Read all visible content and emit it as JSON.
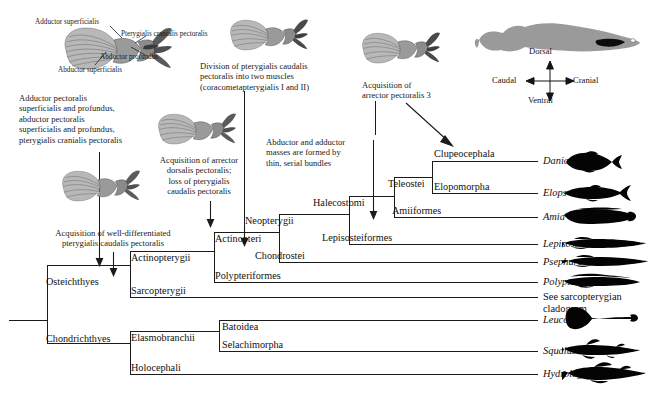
{
  "figure": {
    "type": "phylogenetic-cladogram",
    "background_color": "#ffffff",
    "line_color": "#1b1b1b",
    "silhouette_color": "#000000",
    "fin_fill_color": "#8d8d8d"
  },
  "muscle_labels": [
    {
      "id": "adductor-superficialis",
      "text": "Adductor superficialis"
    },
    {
      "id": "pterygialis-cranialis-pectoralis",
      "text": "Pterygialis cranialis\npectoralis"
    },
    {
      "id": "abductor-profundus",
      "text": "Abductor profundus"
    },
    {
      "id": "abductor-superficialis",
      "text": "Abductor superficialis"
    }
  ],
  "annotations": [
    {
      "id": "ann-osteichthyes-base",
      "text": "Adductor pectoralis\nsuperficialis and profundus,\nabductor pectoralis\nsuperficialis and profundus,\npterygialis cranialis pectoralis"
    },
    {
      "id": "ann-arrector-dorsalis",
      "text": "Acquisition of arrector\ndorsalis pectoralis;\nloss of pterygialis\ncaudalis pectoralis"
    },
    {
      "id": "ann-well-differentiated-pterygialis",
      "text": "Acquisition of well-differentiated\npterygialis caudalis pectoralis"
    },
    {
      "id": "ann-division-pterygialis",
      "text": "Division of pterygialis caudalis\npectoralis into two muscles\n(coracometapterygialis I and II)"
    },
    {
      "id": "ann-serial-bundles",
      "text": "Abductor and adductor\nmasses are formed by\nthin, serial bundles"
    },
    {
      "id": "ann-arrector-pectoralis-3",
      "text": "Acquisition of\narrector pectoralis 3"
    }
  ],
  "clades": [
    {
      "id": "osteichthyes",
      "label": "Osteichthyes"
    },
    {
      "id": "chondrichthyes",
      "label": "Chondrichthyes"
    },
    {
      "id": "actinopterygii",
      "label": "Actinopterygii"
    },
    {
      "id": "sarcopterygii",
      "label": "Sarcopterygii"
    },
    {
      "id": "actinopteri",
      "label": "Actinopteri"
    },
    {
      "id": "polypteriformes",
      "label": "Polypteriformes"
    },
    {
      "id": "neopterygii",
      "label": "Neopterygii"
    },
    {
      "id": "chondrostei",
      "label": "Chondrostei"
    },
    {
      "id": "halecostomi",
      "label": "Halecostomi"
    },
    {
      "id": "lepisosteiformes",
      "label": "Lepisosteiformes"
    },
    {
      "id": "teleostei",
      "label": "Teleostei"
    },
    {
      "id": "amiiformes",
      "label": "Amiiformes"
    },
    {
      "id": "clupeocephala",
      "label": "Clupeocephala"
    },
    {
      "id": "elopomorpha",
      "label": "Elopomorpha"
    },
    {
      "id": "elasmobranchii",
      "label": "Elasmobranchii"
    },
    {
      "id": "holocephali",
      "label": "Holocephali"
    },
    {
      "id": "batoidea",
      "label": "Batoidea"
    },
    {
      "id": "selachimorpha",
      "label": "Selachimorpha"
    }
  ],
  "taxa": [
    {
      "id": "danio",
      "label": "Danio",
      "italic": true,
      "silhouette": "danio"
    },
    {
      "id": "elops",
      "label": "Elops",
      "italic": true,
      "silhouette": "elops"
    },
    {
      "id": "amia",
      "label": "Amia",
      "italic": true,
      "silhouette": "amia"
    },
    {
      "id": "lepisosteus",
      "label": "Lepisosteus",
      "italic": true,
      "silhouette": "lepisosteus"
    },
    {
      "id": "psephurus",
      "label": "Psephurus",
      "italic": true,
      "silhouette": "psephurus"
    },
    {
      "id": "polypterus",
      "label": "Polypterus",
      "italic": true,
      "silhouette": "polypterus"
    },
    {
      "id": "sarcopterygian-ref",
      "label": "See sarcopterygian\ncladogram",
      "italic": false,
      "silhouette": "none"
    },
    {
      "id": "leucoraja",
      "label": "Leucoraja",
      "italic": true,
      "silhouette": "leucoraja"
    },
    {
      "id": "squalus",
      "label": "Squalus",
      "italic": true,
      "silhouette": "squalus"
    },
    {
      "id": "hydrolagus",
      "label": "Hydrolagus",
      "italic": true,
      "silhouette": "hydrolagus"
    }
  ],
  "orientation_key": {
    "dorsal": "Dorsal",
    "ventral": "Ventral",
    "caudal": "Caudal",
    "cranial": "Cranial"
  }
}
